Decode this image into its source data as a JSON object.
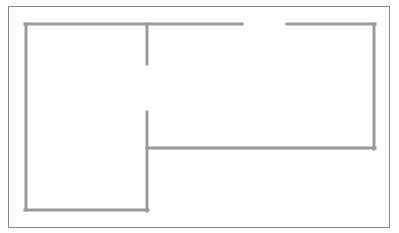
{
  "diagram": {
    "type": "floor-plan",
    "canvas": {
      "width": 399,
      "height": 233
    },
    "colors": {
      "background": "#ffffff",
      "frame": "#8a8a8a",
      "wall": "#9a9a9a"
    },
    "frame": {
      "x": 8,
      "y": 6,
      "width": 382,
      "height": 222,
      "stroke_width": 1
    },
    "walls": [
      {
        "id": "top-wall-left",
        "x1": 25,
        "y1": 24,
        "x2": 242,
        "y2": 24
      },
      {
        "id": "top-wall-right",
        "x1": 287,
        "y1": 24,
        "x2": 375,
        "y2": 24
      },
      {
        "id": "left-wall",
        "x1": 26,
        "y1": 24,
        "x2": 26,
        "y2": 210
      },
      {
        "id": "left-room-bottom-wall",
        "x1": 25,
        "y1": 210,
        "x2": 148,
        "y2": 210
      },
      {
        "id": "partition-upper",
        "x1": 147,
        "y1": 24,
        "x2": 147,
        "y2": 64
      },
      {
        "id": "partition-lower",
        "x1": 147,
        "y1": 112,
        "x2": 147,
        "y2": 211
      },
      {
        "id": "right-room-bottom-wall",
        "x1": 147,
        "y1": 148,
        "x2": 375,
        "y2": 148
      },
      {
        "id": "right-wall",
        "x1": 374,
        "y1": 24,
        "x2": 374,
        "y2": 149
      }
    ],
    "openings": [
      {
        "id": "top-doorway",
        "between": [
          "top-wall-left",
          "top-wall-right"
        ],
        "x_start": 242,
        "x_end": 287,
        "y": 24
      },
      {
        "id": "interior-doorway",
        "between": [
          "partition-upper",
          "partition-lower"
        ],
        "x": 147,
        "y_start": 64,
        "y_end": 112
      }
    ],
    "rooms": [
      {
        "id": "left-room",
        "x": 26,
        "y": 24,
        "width": 121,
        "height": 186
      },
      {
        "id": "right-room",
        "x": 147,
        "y": 24,
        "width": 227,
        "height": 124
      }
    ]
  }
}
